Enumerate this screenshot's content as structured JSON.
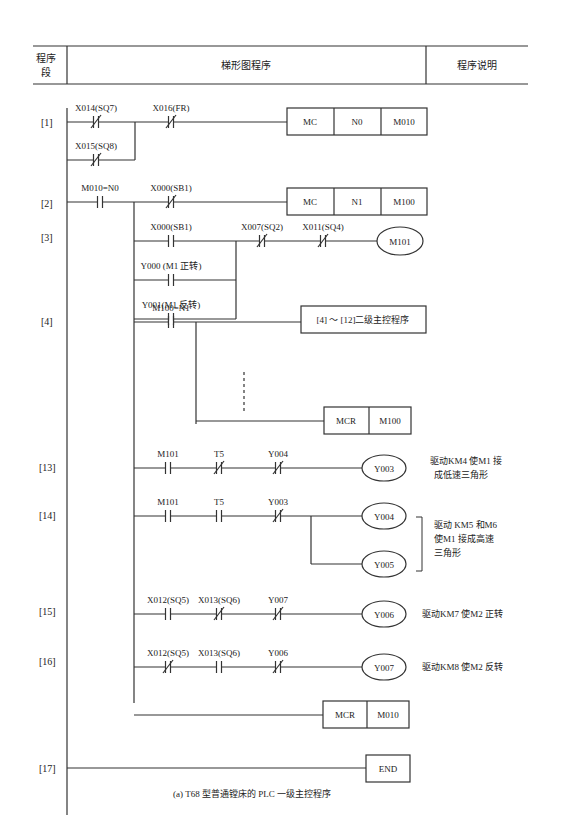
{
  "header": {
    "col1": [
      "程序",
      "段"
    ],
    "col2": "梯形图程序",
    "col3": "程序说明"
  },
  "caption": "(a) T68 型普通镗床的 PLC 一级主控程序",
  "steps": {
    "s1": "[1]",
    "s2": "[2]",
    "s3": "[3]",
    "s4": "[4]",
    "s13": "[13]",
    "s14": "[14]",
    "s15": "[15]",
    "s16": "[16]",
    "s17": "[17]"
  },
  "contacts": {
    "r1a": {
      "label": "X014(SQ7)",
      "type": "NC"
    },
    "r1b": {
      "label": "X015(SQ8)",
      "type": "NC"
    },
    "r1c": {
      "label": "X016(FR)",
      "type": "NC"
    },
    "r2a": {
      "label": "M010=N0",
      "type": "NO"
    },
    "r2b": {
      "label": "X000(SB1)",
      "type": "NC"
    },
    "r3a": {
      "label": "X000(SB1)",
      "type": "NO"
    },
    "r3b": {
      "label": "Y000 (M1 正转)",
      "type": "NO"
    },
    "r3c": {
      "label": "Y001(M1 反转)",
      "type": "NO"
    },
    "r3d": {
      "label": "X007(SQ2)",
      "type": "NC"
    },
    "r3e": {
      "label": "X011(SQ4)",
      "type": "NC"
    },
    "r4a": {
      "label": "M100=N1",
      "type": "NO"
    },
    "r13a": {
      "label": "M101",
      "type": "NO"
    },
    "r13b": {
      "label": "T5",
      "type": "NC"
    },
    "r13c": {
      "label": "Y004",
      "type": "NC"
    },
    "r14a": {
      "label": "M101",
      "type": "NO"
    },
    "r14b": {
      "label": "T5",
      "type": "NO"
    },
    "r14c": {
      "label": "Y003",
      "type": "NC"
    },
    "r15a": {
      "label": "X012(SQ5)",
      "type": "NO"
    },
    "r15b": {
      "label": "X013(SQ6)",
      "type": "NC"
    },
    "r15c": {
      "label": "Y007",
      "type": "NC"
    },
    "r16a": {
      "label": "X012(SQ5)",
      "type": "NC"
    },
    "r16b": {
      "label": "X013(SQ6)",
      "type": "NO"
    },
    "r16c": {
      "label": "Y006",
      "type": "NC"
    }
  },
  "instructions": {
    "mc1": [
      "MC",
      "N0",
      "M010"
    ],
    "mc2": [
      "MC",
      "N1",
      "M100"
    ],
    "sub": "[4] ～ [12]二级主控程序",
    "mcr1": [
      "MCR",
      "M100"
    ],
    "mcr2": [
      "MCR",
      "M010"
    ],
    "end": "END"
  },
  "coils": {
    "m101": "M101",
    "y003": "Y003",
    "y004": "Y004",
    "y005": "Y005",
    "y006": "Y006",
    "y007": "Y007"
  },
  "notes": {
    "n13": [
      "驱动KM4 使M1 接",
      "成低速三角形"
    ],
    "n14": [
      "驱动 KM5 和M6",
      "使M1 接成高速",
      "三角形"
    ],
    "n15": "驱动KM7 使M2 正转",
    "n16": "驱动KM8 使M2 反转"
  }
}
